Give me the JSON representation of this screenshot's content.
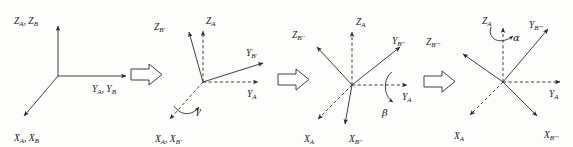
{
  "figure": {
    "background_color": "#fdfdfc",
    "ink_color": "#2b2b2b",
    "panels": [
      {
        "id": "panel-1",
        "origin": [
          58,
          76
        ],
        "rotation_applied": null,
        "axes": [
          {
            "name": "z-axis",
            "label": "Z",
            "subscript": "A, Z",
            "subscript2": "B",
            "full": "Z_A, Z_B",
            "style": "solid",
            "end": [
              58,
              22
            ],
            "label_pos": [
              14,
              20
            ]
          },
          {
            "name": "y-axis",
            "label": "Y",
            "subscript": "A, Y",
            "subscript2": "B",
            "full": "Y_A, Y_B",
            "style": "solid",
            "end": [
              131,
              76
            ],
            "label_pos": [
              92,
              90
            ]
          },
          {
            "name": "x-axis",
            "label": "X",
            "subscript": "A, X",
            "subscript2": "B",
            "full": "X_A, X_B",
            "style": "solid",
            "end": [
              20,
              120
            ],
            "label_pos": [
              16,
              139
            ]
          }
        ]
      },
      {
        "id": "panel-2",
        "origin": [
          203,
          82
        ],
        "rotation_applied": "gamma",
        "angle_symbol": "γ",
        "angle_label_pos": [
          196,
          110
        ],
        "axes": [
          {
            "name": "z-axis-a",
            "label": "Z",
            "subscript": "A",
            "full": "Z_A",
            "style": "dashed",
            "end": [
              203,
              27
            ],
            "label_pos": [
              208,
              22
            ]
          },
          {
            "name": "z-axis-b-prime",
            "label": "Z",
            "subscript": "B'",
            "full": "Z_B'",
            "style": "solid",
            "end": [
              187,
              28
            ],
            "label_pos": [
              156,
              27
            ]
          },
          {
            "name": "y-axis-a",
            "label": "Y",
            "subscript": "A",
            "full": "Y_A",
            "style": "dashed",
            "end": [
              263,
              82
            ],
            "label_pos": [
              250,
              96
            ]
          },
          {
            "name": "y-axis-b-prime",
            "label": "Y",
            "subscript": "B'",
            "full": "Y_B'",
            "style": "solid",
            "end": [
              268,
              61
            ],
            "label_pos": [
              249,
              54
            ]
          },
          {
            "name": "x-axis-a-b-prime",
            "label": "X",
            "subscript": "A, X",
            "subscript2": "B'",
            "full": "X_A, X_B'",
            "style": "dashed",
            "end": [
              166,
              123
            ],
            "label_pos": [
              157,
              140
            ]
          }
        ]
      },
      {
        "id": "panel-3",
        "origin": [
          352,
          85
        ],
        "rotation_applied": "beta",
        "angle_symbol": "β",
        "angle_label_pos": [
          385,
          112
        ],
        "axes": [
          {
            "name": "z-axis-a",
            "label": "Z",
            "subscript": "A",
            "full": "Z_A",
            "style": "dashed",
            "end": [
              352,
              28
            ],
            "label_pos": [
              357,
              23
            ]
          },
          {
            "name": "z-axis-b-dprime",
            "label": "Z",
            "subscript": "B''",
            "full": "Z_B''",
            "style": "solid",
            "end": [
              313,
              44
            ],
            "label_pos": [
              294,
              35
            ]
          },
          {
            "name": "y-axis-a",
            "label": "Y",
            "subscript": "A",
            "full": "Y_A",
            "style": "dashed",
            "end": [
              412,
              85
            ],
            "label_pos": [
              405,
              99
            ]
          },
          {
            "name": "y-axis-b-dprime",
            "label": "Y",
            "subscript": "B''",
            "full": "Y_B''",
            "style": "solid",
            "end": [
              404,
              43
            ],
            "label_pos": [
              394,
              39
            ]
          },
          {
            "name": "x-axis-a",
            "label": "X",
            "subscript": "A",
            "full": "X_A",
            "style": "dashed",
            "end": [
              314,
              123
            ],
            "label_pos": [
              306,
              140
            ]
          },
          {
            "name": "x-axis-b-dprime",
            "label": "X",
            "subscript": "B''",
            "full": "X_B''",
            "style": "solid",
            "end": [
              345,
              128
            ],
            "label_pos": [
              350,
              140
            ]
          }
        ]
      },
      {
        "id": "panel-4",
        "origin": [
          503,
          82
        ],
        "rotation_applied": "alpha",
        "angle_symbol": "α",
        "angle_label_pos": [
          515,
          36
        ],
        "axes": [
          {
            "name": "z-axis-a",
            "label": "Z",
            "subscript": "A",
            "full": "Z_A",
            "style": "dashed",
            "end": [
              503,
              24
            ],
            "label_pos": [
              484,
              22
            ]
          },
          {
            "name": "z-axis-b-tprime",
            "label": "Z",
            "subscript": "B'''",
            "full": "Z_B'''",
            "style": "solid",
            "end": [
              459,
              51
            ],
            "label_pos": [
              428,
              42
            ]
          },
          {
            "name": "y-axis-a",
            "label": "Y",
            "subscript": "A",
            "full": "Y_A",
            "style": "dashed",
            "end": [
              565,
              82
            ],
            "label_pos": [
              553,
              96
            ]
          },
          {
            "name": "y-axis-b-tprime",
            "label": "Y",
            "subscript": "B'''",
            "full": "Y_B'''",
            "style": "solid",
            "end": [
              552,
              25
            ],
            "label_pos": [
              531,
              25
            ]
          },
          {
            "name": "x-axis-a",
            "label": "X",
            "subscript": "A",
            "full": "X_A",
            "style": "dashed",
            "end": [
              466,
              119
            ],
            "label_pos": [
              456,
              138
            ]
          },
          {
            "name": "x-axis-b-tprime",
            "label": "X",
            "subscript": "B'''",
            "full": "X_B'''",
            "style": "solid",
            "end": [
              541,
              120
            ],
            "label_pos": [
              546,
              137
            ]
          }
        ]
      }
    ],
    "connectors": [
      {
        "name": "connector-1",
        "x": 130,
        "y": 76,
        "direction": "right"
      },
      {
        "name": "connector-2",
        "x": 278,
        "y": 80,
        "direction": "right"
      },
      {
        "name": "connector-3",
        "x": 424,
        "y": 82,
        "direction": "right"
      }
    ],
    "angles": [
      {
        "symbol": "γ",
        "name": "gamma",
        "panel": "panel-2",
        "about_axis": "X_A"
      },
      {
        "symbol": "β",
        "name": "beta",
        "panel": "panel-3",
        "about_axis": "Y_A"
      },
      {
        "symbol": "α",
        "name": "alpha",
        "panel": "panel-4",
        "about_axis": "Z_A"
      }
    ]
  }
}
